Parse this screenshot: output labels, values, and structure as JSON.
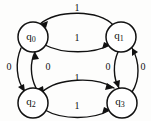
{
  "diagram": {
    "type": "finite-state-automaton",
    "title": "",
    "background_color": "#fdfdfc",
    "stroke_color": "#111111",
    "states": [
      {
        "id": "q0",
        "base": "q",
        "subscript": "0",
        "cx": 33,
        "cy": 37,
        "r": 15
      },
      {
        "id": "q1",
        "base": "q",
        "subscript": "1",
        "cx": 121,
        "cy": 37,
        "r": 15
      },
      {
        "id": "q2",
        "base": "q",
        "subscript": "2",
        "cx": 33,
        "cy": 103,
        "r": 15
      },
      {
        "id": "q3",
        "base": "q",
        "subscript": "3",
        "cx": 122,
        "cy": 103,
        "r": 15
      }
    ],
    "transitions": [
      {
        "id": "t-q1-q0-top",
        "from": "q1",
        "to": "q0",
        "label": "1",
        "label_x": 77,
        "label_y": 9,
        "side": "top"
      },
      {
        "id": "t-q0-q1-inner",
        "from": "q0",
        "to": "q1",
        "label": "1",
        "label_x": 77,
        "label_y": 39,
        "side": "top-inner"
      },
      {
        "id": "t-q0-q2-outer",
        "from": "q0",
        "to": "q2",
        "label": "0",
        "label_x": 9,
        "label_y": 68,
        "side": "left-outer"
      },
      {
        "id": "t-q2-q0-inner",
        "from": "q2",
        "to": "q0",
        "label": "0",
        "label_x": 48,
        "label_y": 68,
        "side": "left-inner"
      },
      {
        "id": "t-q1-q3-inner",
        "from": "q1",
        "to": "q3",
        "label": "0",
        "label_x": 108,
        "label_y": 68,
        "side": "right-inner"
      },
      {
        "id": "t-q3-q1-outer",
        "from": "q3",
        "to": "q1",
        "label": "0",
        "label_x": 143,
        "label_y": 68,
        "side": "right-outer"
      },
      {
        "id": "t-q2-q3-inner",
        "from": "q2",
        "to": "q3",
        "label": "1",
        "label_x": 77,
        "label_y": 79,
        "side": "bottom-inner"
      },
      {
        "id": "t-q2-q3-outer",
        "from": "q2",
        "to": "q3",
        "label": "1",
        "label_x": 77,
        "label_y": 107,
        "side": "bottom-outer"
      }
    ],
    "alphabet": [
      "0",
      "1"
    ]
  }
}
